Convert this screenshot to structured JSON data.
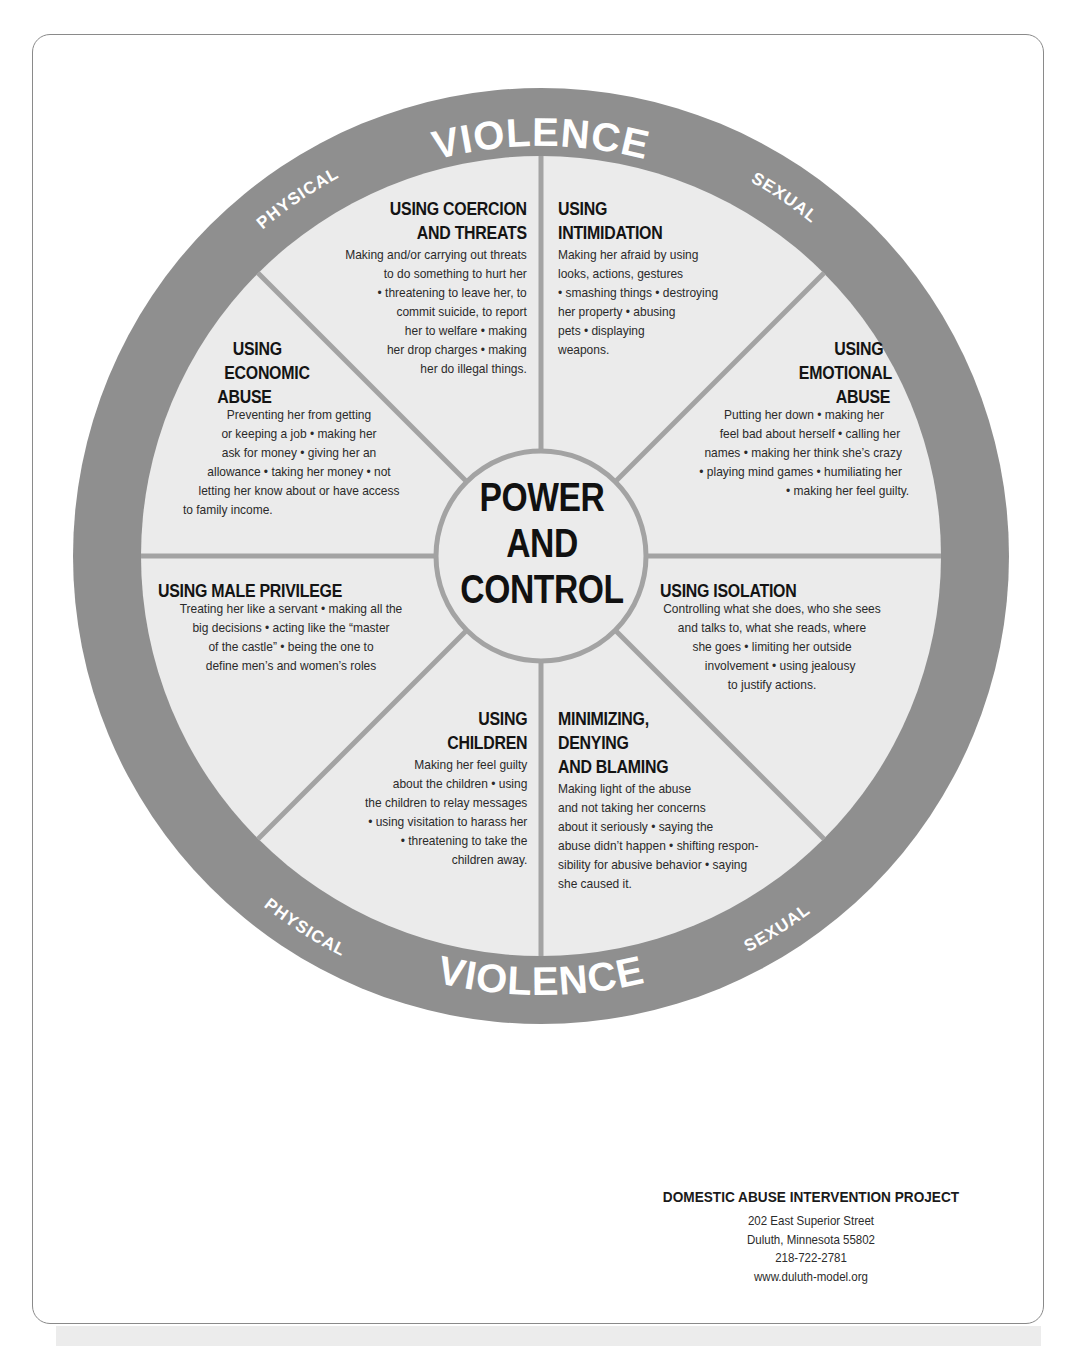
{
  "colors": {
    "outer_ring": "#8f8f8f",
    "inner_disk": "#ebebeb",
    "spokes": "#a3a3a3",
    "ring_text": "#ffffff",
    "text": "#1d1d1d"
  },
  "ring": {
    "top": {
      "left": "PHYSICAL",
      "center": "VIOLENCE",
      "right": "SEXUAL"
    },
    "bottom": {
      "left": "PHYSICAL",
      "center": "VIOLENCE",
      "right": "SEXUAL"
    }
  },
  "center": {
    "lines": [
      "POWER",
      "AND",
      "CONTROL"
    ]
  },
  "segments": {
    "coercion": {
      "heading": [
        "USING COERCION",
        "AND THREATS"
      ],
      "body": [
        "Making and/or carrying out threats",
        "to do something to hurt her",
        "• threatening to leave her, to",
        "commit suicide, to report",
        "her to welfare • making",
        "her drop charges • making",
        "her do illegal things."
      ]
    },
    "intimidation": {
      "heading": [
        "USING",
        "INTIMIDATION"
      ],
      "body": [
        "Making her afraid by using",
        "looks, actions, gestures",
        "• smashing things • destroying",
        "her property • abusing",
        "pets • displaying",
        "weapons."
      ]
    },
    "economic": {
      "heading": [
        "USING",
        "ECONOMIC",
        "ABUSE"
      ],
      "body": [
        "Preventing her from getting",
        "or keeping a job • making her",
        "ask for money • giving her an",
        "allowance • taking her money • not",
        "letting her know about or have access",
        "to family income."
      ]
    },
    "emotional": {
      "heading": [
        "USING",
        "EMOTIONAL",
        "ABUSE"
      ],
      "body": [
        "Putting her down • making her",
        "feel bad about herself • calling her",
        "names • making her think she’s crazy",
        "• playing mind games • humiliating her",
        "• making her feel guilty."
      ]
    },
    "male_privilege": {
      "heading": [
        "USING MALE PRIVILEGE"
      ],
      "body": [
        "Treating her like a servant • making all the",
        "big decisions • acting like the “master",
        "of the castle” • being the one to",
        "define men’s and women’s roles"
      ]
    },
    "isolation": {
      "heading": [
        "USING ISOLATION"
      ],
      "body": [
        "Controlling what she does, who she sees",
        "and talks to, what she reads, where",
        "she goes • limiting her outside",
        "involvement • using jealousy",
        "to justify actions."
      ]
    },
    "children": {
      "heading": [
        "USING",
        "CHILDREN"
      ],
      "body": [
        "Making her feel guilty",
        "about the children • using",
        "the children to relay messages",
        "• using visitation to harass her",
        "• threatening to take the",
        "children away."
      ]
    },
    "minimizing": {
      "heading": [
        "MINIMIZING,",
        "DENYING",
        "AND BLAMING"
      ],
      "body": [
        "Making light of the abuse",
        "and not taking her concerns",
        "about it seriously • saying the",
        "abuse didn’t happen • shifting respon-",
        "sibility for abusive behavior • saying",
        "she caused it."
      ]
    }
  },
  "footer": {
    "organization": "DOMESTIC ABUSE INTERVENTION PROJECT",
    "address_line1": "202 East Superior Street",
    "address_line2": "Duluth, Minnesota 55802",
    "phone": "218-722-2781",
    "website": "www.duluth-model.org"
  }
}
